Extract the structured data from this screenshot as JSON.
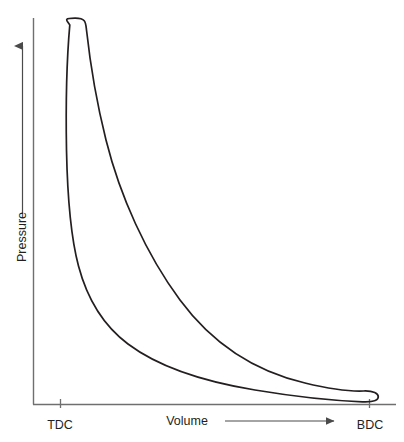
{
  "figure": {
    "kind": "pv-indicator-diagram",
    "background_color": "#ffffff",
    "ink_color": "#231f20",
    "caption_partial": ""
  },
  "axes": {
    "y": {
      "title": "Pressure",
      "arrow_direction": "up",
      "line_color": "#6f6f6f",
      "origin_px": {
        "x": 33,
        "y": 404
      },
      "top_px": {
        "x": 33,
        "y": 18
      }
    },
    "x": {
      "title": "Volume",
      "arrow_direction": "right",
      "line_color": "#6f6f6f",
      "ticks": [
        {
          "label": "TDC",
          "x_px": 60
        },
        {
          "label": "BDC",
          "x_px": 369
        }
      ],
      "right_end_px": {
        "x": 396,
        "y": 404
      }
    }
  },
  "chart_data": {
    "type": "line",
    "title": "",
    "subtitle": "",
    "xlabel": "Volume",
    "ylabel": "Pressure",
    "xlim": [
      0,
      1
    ],
    "ylim": [
      0,
      1
    ],
    "grid": false,
    "legend": false,
    "legend_position": "none",
    "xticklabels": [
      "TDC",
      "BDC"
    ],
    "xtickvalues": [
      0.087,
      1.087
    ],
    "yticklabels": [],
    "annotations": [
      {
        "text": "TDC",
        "meaning": "top dead center",
        "x": 0.087,
        "y": 0.0
      },
      {
        "text": "BDC",
        "meaning": "bottom dead center",
        "x": 1.087,
        "y": 0.0
      },
      {
        "text": "Volume",
        "meaning": "x axis title with rightward arrow",
        "x": 0.5,
        "y": -0.06
      },
      {
        "text": "Pressure",
        "meaning": "y axis title with upward arrow",
        "x": -0.05,
        "y": 0.5
      }
    ],
    "series": [
      {
        "name": "expansion-stroke-upper-branch",
        "description": "Upper branch: combustion peak near TDC falling to BDC",
        "x": [
          0.075,
          0.082,
          0.095,
          0.118,
          0.15,
          0.19,
          0.24,
          0.3,
          0.37,
          0.45,
          0.54,
          0.64,
          0.74,
          0.84,
          0.93,
          1.01,
          1.07,
          1.1
        ],
        "y": [
          0.94,
          0.985,
          0.995,
          0.96,
          0.88,
          0.78,
          0.672,
          0.565,
          0.465,
          0.378,
          0.3,
          0.232,
          0.178,
          0.135,
          0.105,
          0.086,
          0.072,
          0.06
        ]
      },
      {
        "name": "compression-stroke-lower-branch",
        "description": "Lower branch: exhaust/intake at low pressure from BDC back to TDC rising into compression",
        "x": [
          1.1,
          1.075,
          1.01,
          0.93,
          0.83,
          0.72,
          0.61,
          0.5,
          0.4,
          0.31,
          0.235,
          0.175,
          0.132,
          0.104,
          0.086,
          0.076,
          0.072,
          0.075
        ],
        "y": [
          0.04,
          0.028,
          0.021,
          0.021,
          0.026,
          0.034,
          0.045,
          0.059,
          0.077,
          0.1,
          0.131,
          0.178,
          0.25,
          0.36,
          0.52,
          0.7,
          0.86,
          0.94
        ]
      }
    ]
  },
  "curve_path": "M 69.8 24.9 C 66.5 20.0 62.9 18.3 75.0 18.1 C 86.0 18.0 85.6 22.3 86.5 30.0 C 90.0 62.0 96.0 100.0 106.0 140.0 C 120.0 196.0 146.0 254.0 180.0 300.0 C 214.0 346.0 258.0 372.0 305.0 383.0 C 330.0 389.0 352.0 391.5 363.5 391.0 C 373.5 390.6 378.5 393.5 378.3 397.0 C 378.1 400.4 373.0 402.2 362.5 401.8 C 342.0 401.0 300.0 397.5 255.0 390.0 C 205.0 381.8 160.0 368.0 128.0 344.0 C 104.0 326.0 87.5 300.0 78.5 266.0 C 70.5 236.0 67.5 200.0 66.5 150.0 C 65.8 110.0 66.5 62.0 69.8 24.9 Z"
}
